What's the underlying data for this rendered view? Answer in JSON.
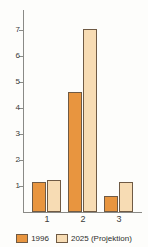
{
  "chart_data": {
    "type": "bar",
    "title": "",
    "subtitle": "",
    "xlabel": "",
    "ylabel": "",
    "categories": [
      "1",
      "2",
      "3"
    ],
    "series": [
      {
        "name": "1996",
        "color": "#e8953f",
        "values": [
          1.17,
          4.62,
          0.6
        ]
      },
      {
        "name": "2025 (Projektion)",
        "color": "#f7dcb4",
        "values": [
          1.23,
          7.05,
          1.17
        ]
      }
    ],
    "ylim": [
      0,
      7.8
    ],
    "yticks": [
      1,
      2,
      3,
      4,
      5,
      6,
      7
    ],
    "ytick_labels": [
      "1",
      "2",
      "3",
      "4",
      "5",
      "6",
      "7"
    ],
    "grid": false,
    "legend_position": "bottom"
  },
  "axis": {
    "y_tick_labels": [
      "7",
      "6",
      "5",
      "4",
      "3",
      "2",
      "1"
    ],
    "x_tick_labels": [
      "1",
      "2",
      "3"
    ]
  },
  "legend": {
    "items": [
      {
        "label": "1996"
      },
      {
        "label": "2025 (Projektion)"
      }
    ]
  },
  "colors": {
    "series_1996": "#e8953f",
    "series_2025": "#f7dcb4",
    "outline": "#6f5a44",
    "axis": "#8a8a86",
    "text": "#2e2e2c",
    "background": "#fdfdfb"
  }
}
